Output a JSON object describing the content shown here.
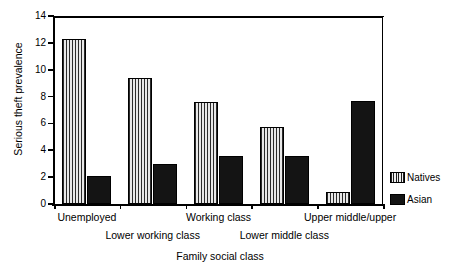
{
  "chart_data": {
    "type": "bar",
    "title": "",
    "xlabel": "Family social class",
    "ylabel": "Serious theft prevalence",
    "categories": [
      "Unemployed",
      "Lower working class",
      "Working class",
      "Lower middle class",
      "Upper middle/upper"
    ],
    "series": [
      {
        "name": "Natives",
        "values": [
          12.3,
          9.4,
          7.6,
          5.7,
          0.9
        ],
        "color": "#b9b9b9",
        "pattern": "vertical-stripes"
      },
      {
        "name": "Asian",
        "values": [
          2.1,
          3.0,
          3.6,
          3.6,
          7.7
        ],
        "color": "#141414",
        "pattern": "solid"
      }
    ],
    "ylim": [
      0,
      14
    ],
    "yticks": [
      0,
      2,
      4,
      6,
      8,
      10,
      12,
      14
    ],
    "ytick_labels": [
      "0",
      "2",
      "4",
      "6",
      "8",
      "10",
      "12",
      "14"
    ],
    "grid": false,
    "legend_position": "right"
  },
  "axis": {
    "y_title": "Serious theft prevalence",
    "x_title": "Family social class"
  },
  "legend": {
    "items": [
      {
        "label": "Natives",
        "swatch": "striped-swatch"
      },
      {
        "label": "Asian",
        "swatch": "solid-black-swatch"
      }
    ]
  }
}
